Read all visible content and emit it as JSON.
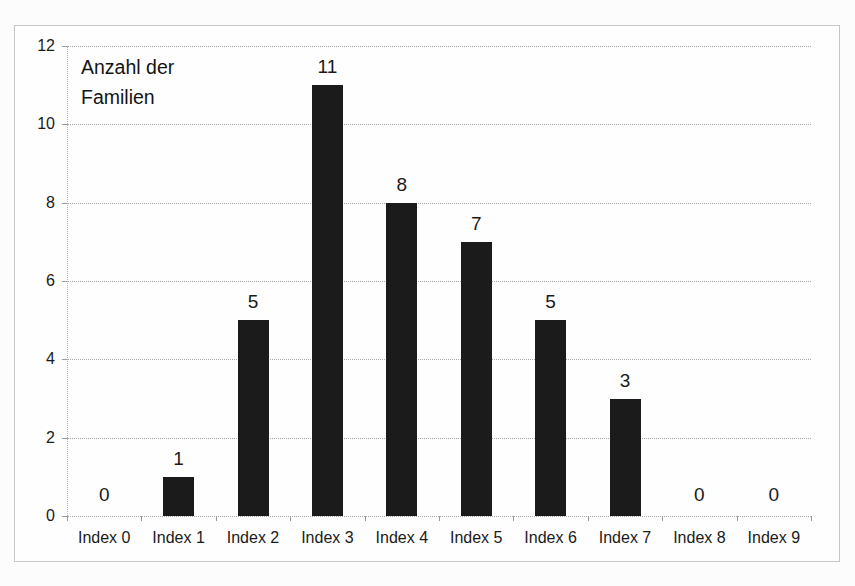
{
  "chart_data": {
    "type": "bar",
    "title": "",
    "annotation": "Anzahl der\nFamilien",
    "categories": [
      "Index 0",
      "Index 1",
      "Index 2",
      "Index 3",
      "Index 4",
      "Index 5",
      "Index 6",
      "Index 7",
      "Index 8",
      "Index 9"
    ],
    "values": [
      0,
      1,
      5,
      11,
      8,
      7,
      5,
      3,
      0,
      0
    ],
    "data_labels": [
      "0",
      "1",
      "5",
      "11",
      "8",
      "7",
      "5",
      "3",
      "0",
      "0"
    ],
    "xlabel": "",
    "ylabel": "",
    "ylim": [
      0,
      12
    ],
    "yticks": [
      0,
      2,
      4,
      6,
      8,
      10,
      12
    ],
    "grid": "horizontal-dotted",
    "legend": "none",
    "colors": {
      "bar": "#1b1b1b",
      "text": "#1a1a1a",
      "gridline": "#a9a9a9",
      "frame_border": "#c6c6c6",
      "background": "#fefefe"
    }
  }
}
